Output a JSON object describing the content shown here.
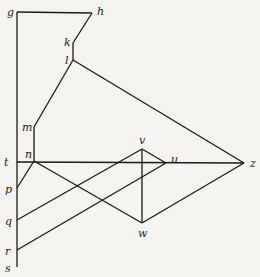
{
  "diagram": {
    "nodes": [
      {
        "id": "g",
        "label": "g"
      },
      {
        "id": "h",
        "label": "h"
      },
      {
        "id": "k",
        "label": "k"
      },
      {
        "id": "l",
        "label": "l"
      },
      {
        "id": "m",
        "label": "m"
      },
      {
        "id": "n",
        "label": "n"
      },
      {
        "id": "t",
        "label": "t"
      },
      {
        "id": "p",
        "label": "p"
      },
      {
        "id": "q",
        "label": "q"
      },
      {
        "id": "r",
        "label": "r"
      },
      {
        "id": "s",
        "label": "s"
      },
      {
        "id": "v",
        "label": "v"
      },
      {
        "id": "u",
        "label": "u"
      },
      {
        "id": "w",
        "label": "w"
      },
      {
        "id": "z",
        "label": "z"
      }
    ],
    "edges": [
      [
        "g",
        "h"
      ],
      [
        "h",
        "k"
      ],
      [
        "k",
        "l"
      ],
      [
        "l",
        "m"
      ],
      [
        "m",
        "n"
      ],
      [
        "g",
        "s"
      ],
      [
        "t",
        "z"
      ],
      [
        "l",
        "z"
      ],
      [
        "p",
        "n"
      ],
      [
        "n",
        "w"
      ],
      [
        "q",
        "v"
      ],
      [
        "r",
        "u"
      ],
      [
        "v",
        "u"
      ],
      [
        "v",
        "w"
      ],
      [
        "w",
        "z"
      ]
    ]
  }
}
